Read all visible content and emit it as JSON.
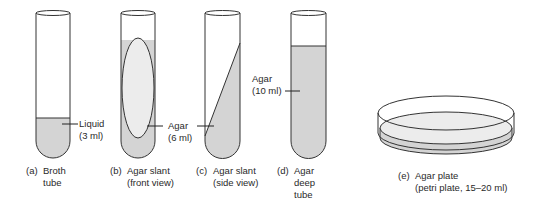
{
  "colors": {
    "outline": "#333333",
    "medium_fill": "#d4d4d4",
    "ellipse_fill": "#e8e8e8",
    "background": "#ffffff"
  },
  "tubes": [
    {
      "id": "a",
      "letter": "(a)",
      "caption_lines": [
        "Broth",
        "tube"
      ],
      "callout_lines": [
        "Liquid",
        "(3 ml)"
      ],
      "medium": "liquid"
    },
    {
      "id": "b",
      "letter": "(b)",
      "caption_lines": [
        "Agar slant",
        "(front view)"
      ],
      "callout_lines": [
        "Agar",
        "(6 ml)"
      ],
      "medium": "agar"
    },
    {
      "id": "c",
      "letter": "(c)",
      "caption_lines": [
        "Agar slant",
        "(side view)"
      ],
      "callout_lines": [
        "Agar",
        "(6 ml)"
      ],
      "medium": "agar"
    },
    {
      "id": "d",
      "letter": "(d)",
      "caption_lines": [
        "Agar",
        "deep",
        "tube"
      ],
      "callout_lines": [
        "Agar",
        "(10 ml)"
      ],
      "medium": "agar"
    }
  ],
  "plate": {
    "id": "e",
    "letter": "(e)",
    "caption_lines": [
      "Agar plate",
      "(petri plate, 15–20 ml)"
    ]
  }
}
